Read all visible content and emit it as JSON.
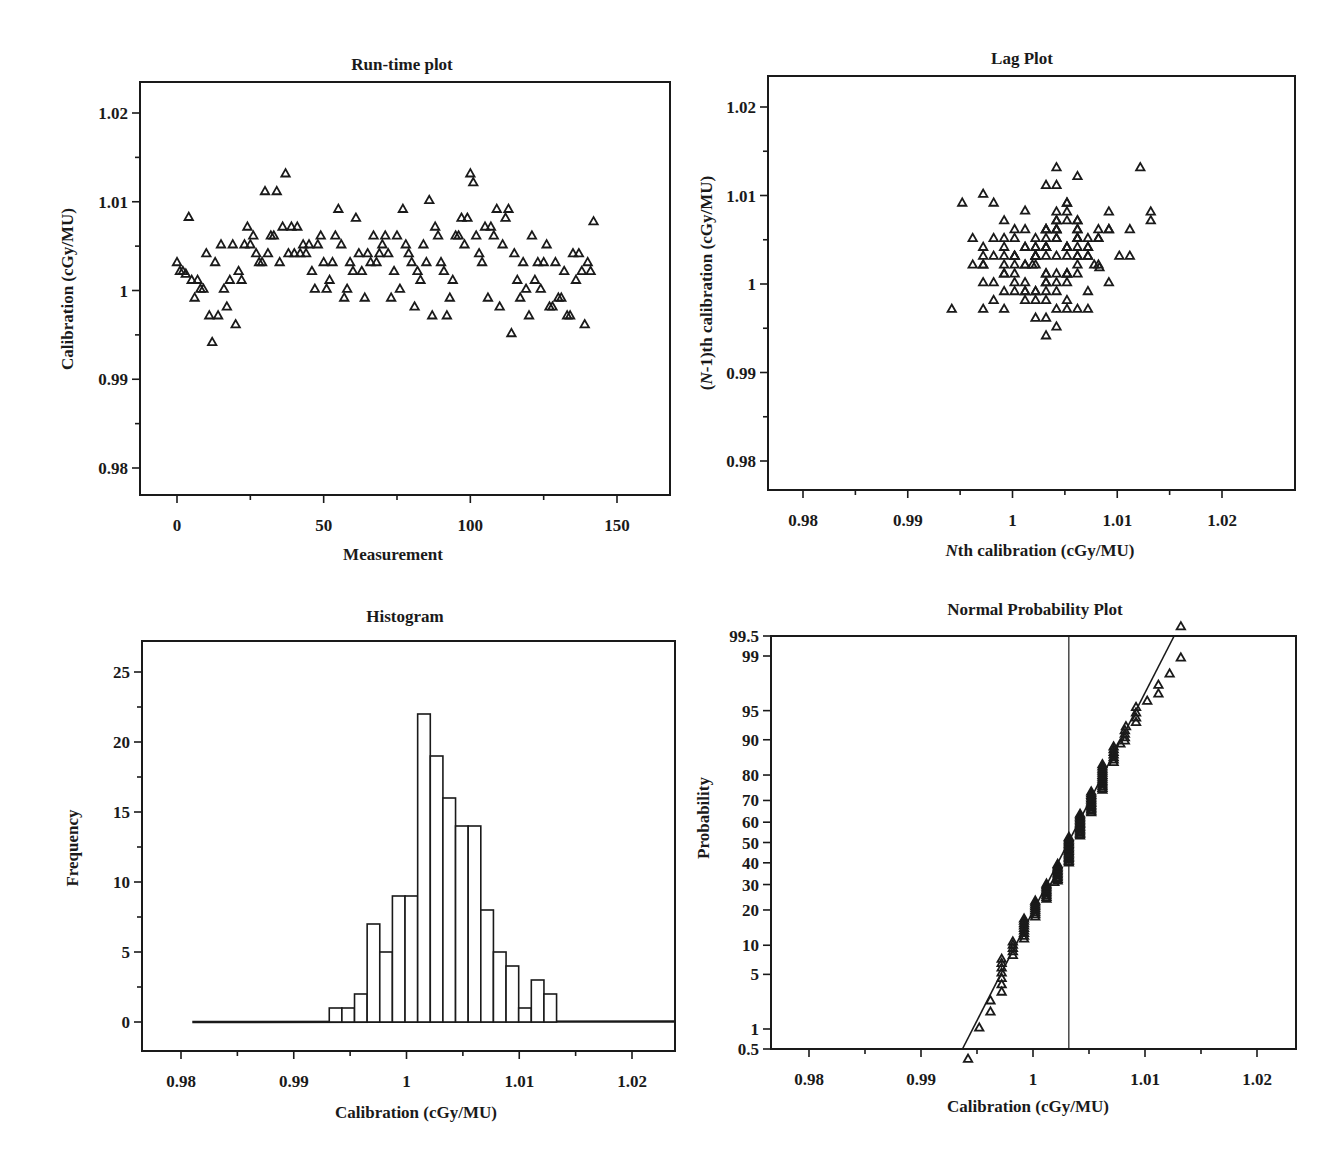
{
  "figure": {
    "background": "#ffffff",
    "ink_color": "#1a1a1a"
  },
  "chart_data": [
    {
      "id": "runtime",
      "type": "scatter",
      "title": "Run-time plot",
      "xlabel": "Measurement",
      "ylabel": "Calibration (cGy/MU)",
      "xlim": [
        -13,
        168
      ],
      "ylim": [
        0.9764,
        1.0235
      ],
      "xticks": [
        0,
        50,
        100,
        150
      ],
      "xtick_labels": [
        "0",
        "50",
        "100",
        "150"
      ],
      "yticks": [
        0.98,
        0.99,
        1.0,
        1.01,
        1.02
      ],
      "ytick_labels": [
        "0.98",
        "0.99",
        "1",
        "1.01",
        "1.02"
      ],
      "grid": false,
      "marker": "open-triangle",
      "x": [
        0,
        1,
        2,
        3,
        4,
        5,
        6,
        7,
        8,
        9,
        10,
        11,
        12,
        13,
        14,
        15,
        16,
        17,
        18,
        19,
        20,
        21,
        22,
        23,
        24,
        25,
        26,
        27,
        28,
        29,
        30,
        31,
        32,
        33,
        34,
        35,
        36,
        37,
        38,
        39,
        40,
        41,
        42,
        43,
        44,
        45,
        46,
        47,
        48,
        49,
        50,
        51,
        52,
        53,
        54,
        55,
        56,
        57,
        58,
        59,
        60,
        61,
        62,
        63,
        64,
        65,
        66,
        67,
        68,
        69,
        70,
        71,
        72,
        73,
        74,
        75,
        76,
        77,
        78,
        79,
        80,
        81,
        82,
        83,
        84,
        85,
        86,
        87,
        88,
        89,
        90,
        91,
        92,
        93,
        94,
        95,
        96,
        97,
        98,
        99,
        100,
        101,
        102,
        103,
        104,
        105,
        106,
        107,
        108,
        109,
        110,
        111,
        112,
        113,
        114,
        115,
        116,
        117,
        118,
        119,
        120,
        121,
        122,
        123,
        124,
        125,
        126,
        127,
        128,
        129,
        130,
        131,
        132,
        133,
        134,
        135,
        136,
        137,
        138,
        139,
        140,
        141,
        142
      ],
      "y": [
        1.0032,
        1.0022,
        1.0022,
        1.0019,
        1.0083,
        1.0012,
        0.9992,
        1.0012,
        1.0002,
        1.0002,
        1.0042,
        0.9972,
        0.9942,
        1.0032,
        0.9972,
        1.0052,
        1.0002,
        0.9982,
        1.0012,
        1.0052,
        0.9962,
        1.0022,
        1.0012,
        1.0052,
        1.0072,
        1.0052,
        1.0062,
        1.0042,
        1.0032,
        1.0032,
        1.0112,
        1.0042,
        1.0062,
        1.0062,
        1.0112,
        1.0032,
        1.0072,
        1.0132,
        1.0042,
        1.0072,
        1.0042,
        1.0072,
        1.0042,
        1.0052,
        1.0042,
        1.0052,
        1.0022,
        1.0002,
        1.0052,
        1.0062,
        1.0032,
        1.0002,
        1.0012,
        1.0032,
        1.0062,
        1.0092,
        1.0052,
        0.9992,
        1.0002,
        1.0032,
        1.0022,
        1.0082,
        1.0042,
        1.0022,
        0.9992,
        1.0042,
        1.0032,
        1.0062,
        1.0032,
        1.0042,
        1.0052,
        1.0062,
        1.0042,
        0.9992,
        1.0022,
        1.0062,
        1.0002,
        1.0092,
        1.0052,
        1.0042,
        1.0032,
        0.9982,
        1.0022,
        1.0012,
        1.0052,
        1.0032,
        1.0102,
        0.9972,
        1.0072,
        1.0062,
        1.0032,
        1.0022,
        0.9972,
        0.9992,
        1.0012,
        1.0062,
        1.0062,
        1.0082,
        1.0052,
        1.0082,
        1.0132,
        1.0122,
        1.0062,
        1.0042,
        1.0032,
        1.0072,
        0.9992,
        1.0072,
        1.0062,
        1.0092,
        0.9982,
        1.0052,
        1.0082,
        1.0092,
        0.9952,
        1.0042,
        1.0012,
        0.9992,
        1.0032,
        1.0002,
        0.9972,
        1.0062,
        1.0012,
        1.0032,
        1.0002,
        1.0032,
        1.0052,
        0.9982,
        0.9982,
        1.0032,
        0.9992,
        0.9992,
        1.0022,
        0.9972,
        0.9972,
        1.0042,
        1.0012,
        1.0042,
        1.0022,
        0.9962,
        1.0032,
        1.0022,
        1.0078
      ]
    },
    {
      "id": "lag",
      "type": "scatter",
      "title": "Lag Plot",
      "xlabel_prefix": "N",
      "xlabel_rest": "th calibration (cGy/MU)",
      "ylabel_prefix": "(",
      "ylabel_italic": "N",
      "ylabel_rest": "-1)th calibration (cGy/MU)",
      "xlim": [
        0.9768,
        1.0234
      ],
      "ylim": [
        0.9767,
        1.0234
      ],
      "xticks": [
        0.98,
        0.99,
        1.0,
        1.01,
        1.02
      ],
      "xtick_labels": [
        "0.98",
        "0.99",
        "1",
        "1.01",
        "1.02"
      ],
      "yticks": [
        0.98,
        0.99,
        1.0,
        1.01,
        1.02
      ],
      "ytick_labels": [
        "0.98",
        "0.99",
        "1",
        "1.01",
        "1.02"
      ],
      "grid": false,
      "marker": "open-triangle",
      "derived_from": "runtime",
      "note": "points are (value[i], value[i-1]) pairs of the run-time series"
    },
    {
      "id": "histogram",
      "type": "bar",
      "title": "Histogram",
      "xlabel": "Calibration (cGy/MU)",
      "ylabel": "Frequency",
      "xlim": [
        0.9766,
        1.0236
      ],
      "ylim": [
        -2.0,
        27.0
      ],
      "xticks": [
        0.98,
        0.99,
        1.0,
        1.01,
        1.02
      ],
      "xtick_labels": [
        "0.98",
        "0.99",
        "1",
        "1.01",
        "1.02"
      ],
      "yticks": [
        0,
        5,
        10,
        15,
        20,
        25
      ],
      "ytick_labels": [
        "0",
        "5",
        "10",
        "15",
        "20",
        "25"
      ],
      "grid": false,
      "bin_start": 0.99315,
      "bin_width": 0.00112,
      "values": [
        1,
        1,
        2,
        7,
        5,
        9,
        9,
        22,
        19,
        16,
        14,
        14,
        8,
        5,
        4,
        1,
        3,
        2
      ],
      "baseline_from": 0.981,
      "total_count": 142
    },
    {
      "id": "normprob",
      "type": "scatter",
      "title": "Normal Probability Plot",
      "xlabel": "Calibration (cGy/MU)",
      "ylabel": "Probability",
      "xlim": [
        0.9766,
        1.0235
      ],
      "ylim_percent": [
        0.5,
        99.5
      ],
      "xticks": [
        0.98,
        0.99,
        1.0,
        1.01,
        1.02
      ],
      "xtick_labels": [
        "0.98",
        "0.99",
        "1",
        "1.01",
        "1.02"
      ],
      "yticks": [
        0.5,
        1,
        5,
        10,
        20,
        30,
        40,
        50,
        60,
        70,
        80,
        90,
        95,
        99,
        99.5
      ],
      "ytick_labels": [
        "0.5",
        "1",
        "5",
        "10",
        "20",
        "30",
        "40",
        "50",
        "60",
        "70",
        "80",
        "90",
        "95",
        "99",
        "99.5"
      ],
      "grid": false,
      "marker": "open-triangle",
      "derived_from": "runtime",
      "mean_line_x": 1.0032,
      "fit_line": {
        "x_at_0_5": 0.9937,
        "x_at_99_5": 1.0126
      }
    }
  ]
}
